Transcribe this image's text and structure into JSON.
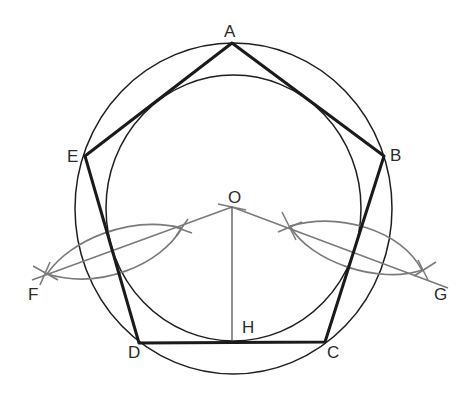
{
  "diagram": {
    "colors": {
      "background": "#ffffff",
      "polygon": "#1a1a1a",
      "circles": "#1e1e1e",
      "construction": "#7a7a7a",
      "labels": "#2a2a2a"
    },
    "labels": {
      "A": "A",
      "B": "B",
      "C": "C",
      "D": "D",
      "E": "E",
      "O": "O",
      "H": "H",
      "F": "F",
      "G": "G"
    },
    "points": {
      "A": [
        232,
        43
      ],
      "B": [
        384,
        156
      ],
      "C": [
        325,
        342
      ],
      "D": [
        139,
        343
      ],
      "E": [
        85,
        156
      ],
      "O": [
        232,
        207
      ],
      "H": [
        232,
        342
      ],
      "F": [
        47,
        274
      ],
      "G": [
        422,
        270
      ]
    },
    "circumscribed_circle": {
      "cx": 233.5,
      "cy": 208.5,
      "rx": 158.5,
      "ry": 165.5
    },
    "inscribed_circle": {
      "cx": 233.5,
      "cy": 208,
      "rx": 127.5,
      "ry": 133
    }
  }
}
